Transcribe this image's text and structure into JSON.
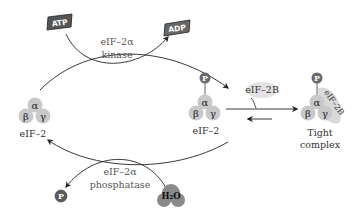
{
  "diagram": {
    "colors": {
      "subunit_fill": "#c9c9c9",
      "phosphate_fill": "#6a6a6a",
      "eif2b_fill": "#d9d9d9",
      "h2o_fill": "#8a8a8a",
      "line": "#222222",
      "text": "#333333"
    },
    "nodes": {
      "left_eif2": {
        "label": "eIF–2",
        "subunits": {
          "alpha": "α",
          "beta": "β",
          "gamma": "γ"
        }
      },
      "middle_eif2": {
        "label": "eIF–2",
        "phosphate": "P",
        "subunits": {
          "alpha": "α",
          "beta": "β",
          "gamma": "γ"
        }
      },
      "tight_complex": {
        "label_line1": "Tight",
        "label_line2": "complex",
        "phosphate": "P",
        "bound_factor": "eIF–2B",
        "subunits": {
          "alpha": "α",
          "beta": "β",
          "gamma": "γ"
        }
      }
    },
    "reactions": {
      "kinase": {
        "enzyme_line1": "eIF–2α",
        "enzyme_line2": "kinase",
        "substrate": "ATP",
        "product": "ADP"
      },
      "phosphatase": {
        "enzyme_line1": "eIF–2α",
        "enzyme_line2": "phosphatase",
        "substrate": "H₂O",
        "product": "P"
      },
      "binding": {
        "factor": "eIF–2B"
      }
    }
  }
}
